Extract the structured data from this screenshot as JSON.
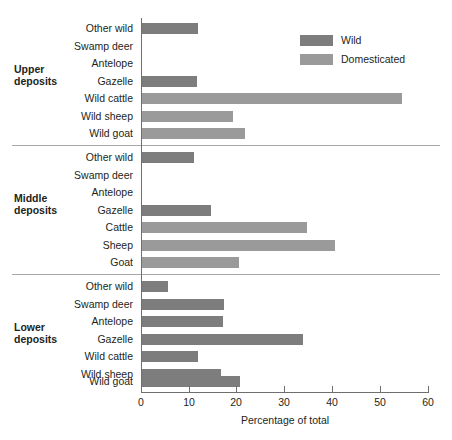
{
  "chart_data": {
    "type": "bar",
    "orientation": "horizontal",
    "title": "",
    "xlabel": "Percentage of total",
    "ylabel": "",
    "xlim": [
      0,
      60
    ],
    "xticks": [
      0,
      10,
      20,
      30,
      40,
      50,
      60
    ],
    "grid": false,
    "legend_position": "top-right",
    "legend": [
      {
        "name": "Wild",
        "color": "#7d7d7d"
      },
      {
        "name": "Domesticated",
        "color": "#9a9a9a"
      }
    ],
    "groups": [
      {
        "name": "Upper deposits",
        "categories": [
          "Other wild",
          "Swamp deer",
          "Antelope",
          "Gazelle",
          "Wild cattle",
          "Wild sheep",
          "Wild goat"
        ],
        "values": [
          11.7,
          0,
          0,
          11.5,
          54.6,
          19.1,
          21.6
        ],
        "types": [
          "Wild",
          "Wild",
          "Wild",
          "Wild",
          "Domesticated",
          "Domesticated",
          "Domesticated"
        ]
      },
      {
        "name": "Middle deposits",
        "categories": [
          "Other wild",
          "Swamp deer",
          "Antelope",
          "Gazelle",
          "Cattle",
          "Sheep",
          "Goat"
        ],
        "values": [
          10.9,
          0,
          0,
          14.5,
          34.7,
          40.5,
          20.3
        ],
        "types": [
          "Wild",
          "Wild",
          "Wild",
          "Wild",
          "Domesticated",
          "Domesticated",
          "Domesticated"
        ]
      },
      {
        "name": "Lower deposits",
        "categories": [
          "Other wild",
          "Swamp deer",
          "Antelope",
          "Gazelle",
          "Wild cattle",
          "Wild sheep",
          "Wild goat"
        ],
        "values": [
          5.5,
          17.2,
          17.0,
          33.7,
          11.7,
          16.6,
          20.6
        ],
        "types": [
          "Wild",
          "Wild",
          "Wild",
          "Wild",
          "Wild",
          "Wild",
          "Wild"
        ]
      }
    ]
  },
  "axis": {
    "tick_labels": [
      "0",
      "10",
      "20",
      "30",
      "40",
      "50",
      "60"
    ],
    "title": "Percentage of total"
  },
  "legend": {
    "wild_label": "Wild",
    "domesticated_label": "Domesticated"
  },
  "groups": {
    "upper": {
      "line1": "Upper",
      "line2": "deposits"
    },
    "middle": {
      "line1": "Middle",
      "line2": "deposits"
    },
    "lower": {
      "line1": "Lower",
      "line2": "deposits"
    }
  }
}
